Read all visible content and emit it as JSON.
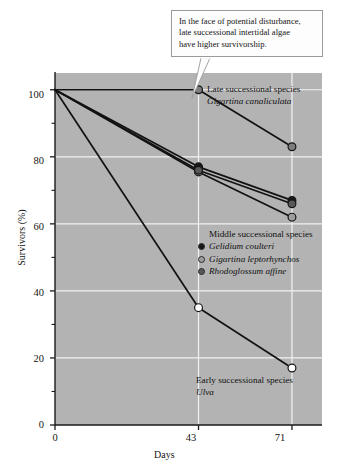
{
  "callout": {
    "lines": [
      "In the face of potential disturbance,",
      "late successional intertidal algae",
      "have higher survivorship."
    ]
  },
  "annotations": {
    "late": {
      "title": "Late successional species",
      "species": "Gigartina canaliculata"
    },
    "early": {
      "title": "Early successional species",
      "species": "Ulva"
    },
    "middle_title": "Middle successional species"
  },
  "axes": {
    "x_title": "Days",
    "y_title": "Survivors (%)",
    "x_ticks": [
      "0",
      "43",
      "71"
    ],
    "y_ticks": [
      "0",
      "20",
      "40",
      "60",
      "80",
      "100"
    ]
  },
  "colors": {
    "plot_background": "#b3b3b3",
    "gridline": "#f2f2f2",
    "axis": "#1a1a1a",
    "line": "#121212",
    "marker_black": "#181818",
    "marker_dark_gray": "#595959",
    "marker_mid_gray": "#7d7d7d",
    "marker_light_gray": "#9e9e9e",
    "marker_open": "#ffffff",
    "callout_border": "#9a9a9a",
    "callout_background": "#fdfdfd"
  },
  "chart_data": {
    "type": "line",
    "title": "",
    "subtitle": "",
    "xlabel": "Days",
    "ylabel": "Survivors (%)",
    "x": [
      0,
      43,
      71
    ],
    "xlim": [
      0,
      80
    ],
    "ylim": [
      0,
      105
    ],
    "x_tick_values": [
      0,
      43,
      71
    ],
    "y_tick_values": [
      0,
      20,
      40,
      60,
      80,
      100
    ],
    "y_minor_tick_values": [
      10,
      30,
      50,
      70,
      90
    ],
    "grid": true,
    "grid_axis": "both",
    "legend_position": "inside-right-middle",
    "series": [
      {
        "name": "Gigartina canaliculata",
        "group": "Late successional species",
        "values": [
          100,
          100,
          83
        ],
        "marker": "filled-circle",
        "marker_color": "#7d7d7d"
      },
      {
        "name": "Gelidium coulteri",
        "group": "Middle successional species",
        "values": [
          100,
          77,
          67
        ],
        "marker": "filled-circle",
        "marker_color": "#181818"
      },
      {
        "name": "Gigartina leptorhynchos",
        "group": "Middle successional species",
        "values": [
          100,
          75.5,
          62
        ],
        "marker": "filled-circle",
        "marker_color": "#9e9e9e"
      },
      {
        "name": "Rhodoglossum affine",
        "group": "Middle successional species",
        "values": [
          100,
          76,
          66
        ],
        "marker": "filled-circle",
        "marker_color": "#595959"
      },
      {
        "name": "Ulva",
        "group": "Early successional species",
        "values": [
          100,
          35,
          17
        ],
        "marker": "open-circle",
        "marker_color": "#ffffff"
      }
    ]
  }
}
